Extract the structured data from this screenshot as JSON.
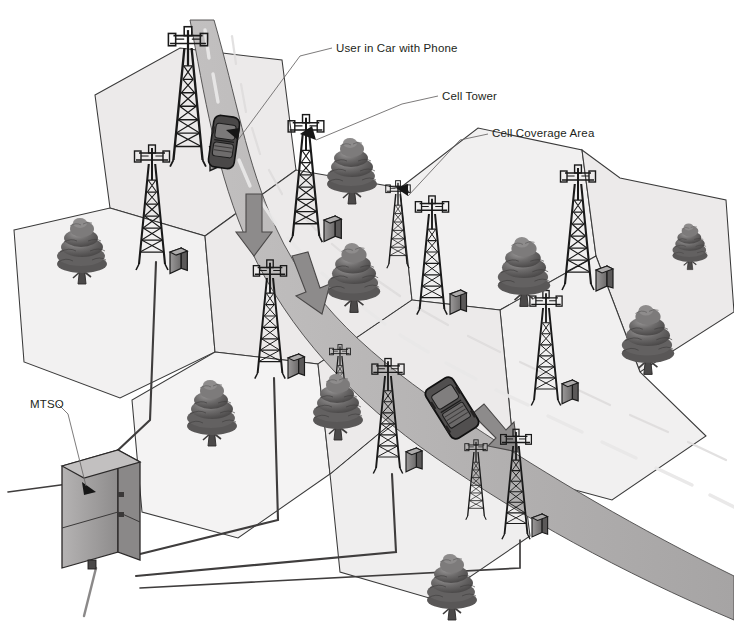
{
  "diagram": {
    "background_color": "#ffffff",
    "ink_color": "#231f20"
  },
  "labels": [
    {
      "id": "user-in-car",
      "text": "User in Car with Phone",
      "x": 336,
      "y": 42,
      "leader_to": "car on highway in upper cell"
    },
    {
      "id": "cell-tower",
      "text": "Cell Tower",
      "x": 442,
      "y": 90,
      "leader_to": "lattice tower antenna in middle cell"
    },
    {
      "id": "cell-coverage-area",
      "text": "Cell Coverage Area",
      "x": 492,
      "y": 127,
      "leader_to": "shaded hexagonal cell polygon"
    },
    {
      "id": "mtso",
      "text": "MTSO",
      "x": 30,
      "y": 398,
      "leader_to": "gray switching office box at lower left"
    }
  ],
  "palette": {
    "cell_fill": "#eceaea",
    "cell_fill_light": "#f2f1f1",
    "cell_stroke": "#3a3a3a",
    "road_fill": "#b9b7b7",
    "road_fill_dark": "#a8a6a6",
    "road_mark": "#e8e7e7",
    "tree_dark": "#4f4d4d",
    "tree_mid": "#6f6d6d",
    "tree_light": "#8c8a8a",
    "tower_ink": "#1a1a1a",
    "cabinet_face": "#8d8b8b",
    "cabinet_side": "#5e5c5c",
    "cabinet_top": "#aaa8a8",
    "car_body": "#4a4848",
    "car_glass": "#777575",
    "mtso_face": "#a9a7a7",
    "mtso_side": "#8a8888",
    "mtso_top": "#c0bebe",
    "cable": "#3f3d3d",
    "leader_line": "#6e6c6c",
    "text": "#231f20"
  },
  "scene_elements": {
    "cell_count": 9,
    "tower_count": 12,
    "tree_count": 9,
    "vehicle_count": 2,
    "mtso_count": 1,
    "road_name": "curved highway",
    "road_direction_arrows": 3
  },
  "cells": [
    {
      "id": "cell-nw",
      "points": "95,95 180,48 282,60 296,170 205,236 110,208",
      "fill": "#eceaea"
    },
    {
      "id": "cell-w",
      "points": "14,230 110,208 205,236 215,352 120,398 24,362",
      "fill": "#f2f1f1"
    },
    {
      "id": "cell-n-road",
      "points": "282,60 352,104 368,196 296,170",
      "fill": "#e7e5e5"
    },
    {
      "id": "cell-c",
      "points": "205,236 296,170 400,188 412,300 318,364 215,352",
      "fill": "#eceaea"
    },
    {
      "id": "cell-ne",
      "points": "400,188 478,128 582,150 596,256 500,310 412,300",
      "fill": "#f1f0f0"
    },
    {
      "id": "cell-e",
      "points": "596,256 620,186 716,206 726,316 632,376 596,256",
      "fill": "#eceaea"
    },
    {
      "id": "cell-sw",
      "points": "215,352 318,364 330,474 238,538 142,512 132,400",
      "fill": "#f4f3f3"
    },
    {
      "id": "cell-s",
      "points": "330,474 412,406 516,424 530,536 436,600 340,572",
      "fill": "#efeeee"
    },
    {
      "id": "cell-se",
      "points": "500,310 596,256 632,376 700,430 606,494 512,470",
      "fill": "#f1f0f0"
    }
  ],
  "towers": [
    {
      "id": "tower-1",
      "x": 188,
      "y": 32,
      "h": 130,
      "w": 30,
      "cabinet": "right"
    },
    {
      "id": "tower-2",
      "x": 152,
      "y": 148,
      "h": 118,
      "w": 26,
      "cabinet": "right"
    },
    {
      "id": "tower-3",
      "x": 306,
      "y": 118,
      "h": 118,
      "w": 26,
      "cabinet": "right"
    },
    {
      "id": "tower-4",
      "x": 270,
      "y": 262,
      "h": 110,
      "w": 24,
      "cabinet": "right"
    },
    {
      "id": "tower-5",
      "x": 432,
      "y": 198,
      "h": 110,
      "w": 24,
      "cabinet": "right"
    },
    {
      "id": "tower-6",
      "x": 578,
      "y": 168,
      "h": 118,
      "w": 26,
      "cabinet": "right"
    },
    {
      "id": "tower-7",
      "x": 546,
      "y": 292,
      "h": 110,
      "w": 24,
      "cabinet": "right"
    },
    {
      "id": "tower-8",
      "x": 388,
      "y": 360,
      "h": 108,
      "w": 24,
      "cabinet": "right"
    },
    {
      "id": "tower-9",
      "x": 516,
      "y": 430,
      "h": 104,
      "w": 22,
      "cabinet": "right"
    },
    {
      "id": "tower-10",
      "x": 398,
      "y": 182,
      "h": 84,
      "w": 20,
      "cabinet": "none"
    },
    {
      "id": "tower-11",
      "x": 476,
      "y": 440,
      "h": 78,
      "w": 18,
      "cabinet": "none"
    },
    {
      "id": "tower-12",
      "x": 340,
      "y": 344,
      "h": 70,
      "w": 18,
      "cabinet": "none"
    }
  ],
  "trees": [
    {
      "id": "tree-1",
      "x": 82,
      "y": 236,
      "s": 1.0
    },
    {
      "id": "tree-2",
      "x": 354,
      "y": 262,
      "s": 1.05
    },
    {
      "id": "tree-3",
      "x": 352,
      "y": 156,
      "s": 1.0
    },
    {
      "id": "tree-4",
      "x": 524,
      "y": 256,
      "s": 1.05
    },
    {
      "id": "tree-5",
      "x": 648,
      "y": 324,
      "s": 1.05
    },
    {
      "id": "tree-6",
      "x": 212,
      "y": 398,
      "s": 1.0
    },
    {
      "id": "tree-7",
      "x": 338,
      "y": 392,
      "s": 1.0
    },
    {
      "id": "tree-8",
      "x": 452,
      "y": 572,
      "s": 1.0
    },
    {
      "id": "tree-9",
      "x": 690,
      "y": 236,
      "s": 0.7
    }
  ],
  "vehicles": [
    {
      "id": "car-sedan",
      "x": 224,
      "y": 142,
      "rot": 8,
      "type": "sedan"
    },
    {
      "id": "car-suv",
      "x": 452,
      "y": 408,
      "rot": -32,
      "type": "suv"
    }
  ],
  "mtso_box": {
    "x": 62,
    "y": 448,
    "w": 72,
    "h": 118
  },
  "connections": [
    {
      "from": "tower-2",
      "to": "mtso"
    },
    {
      "from": "tower-4",
      "to": "mtso"
    },
    {
      "from": "tower-8",
      "to": "mtso"
    },
    {
      "from": "tower-9",
      "to": "mtso"
    }
  ]
}
